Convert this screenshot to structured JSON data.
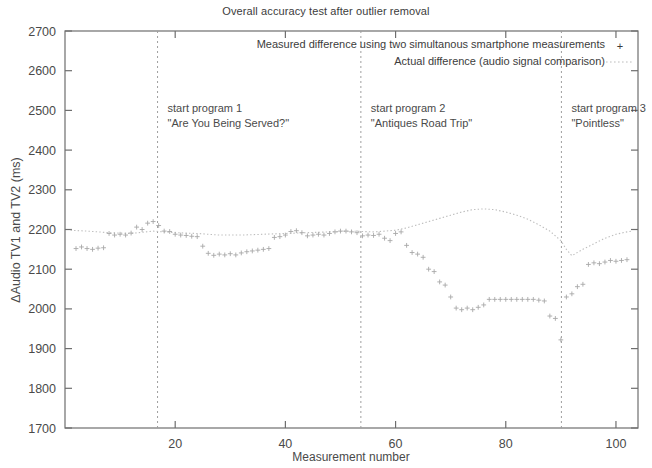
{
  "chart_data": {
    "type": "scatter",
    "title": "Overall accuracy test after outlier removal",
    "xlabel": "Measurement number",
    "ylabel": "ΔAudio TV1 and TV2 (ms)",
    "xlim": [
      0,
      104
    ],
    "ylim": [
      1700,
      2700
    ],
    "xticks": [
      20,
      40,
      60,
      80,
      100
    ],
    "yticks": [
      1700,
      1800,
      1900,
      2000,
      2100,
      2200,
      2300,
      2400,
      2500,
      2600,
      2700
    ],
    "grid": false,
    "legend_position": "top-center",
    "legend": [
      {
        "label": "Measured difference using two simultanous smartphone measurements",
        "marker": "plus",
        "style": "points",
        "color": "#9a9a9a"
      },
      {
        "label": "Actual difference (audio signal comparison)",
        "marker": "dotted-line",
        "style": "line",
        "color": "#b0b0b0"
      }
    ],
    "annotations": [
      {
        "x": 16.8,
        "line1": "start program 1",
        "line2": "\"Are You Being Served?\""
      },
      {
        "x": 53.7,
        "line1": "start program 2",
        "line2": "\"Antiques Road Trip\""
      },
      {
        "x": 90.1,
        "line1": "start program 3",
        "line2": "\"Pointless\""
      }
    ],
    "series": [
      {
        "name": "Measured difference using two simultanous smartphone measurements",
        "marker": "plus",
        "points": [
          [
            2,
            2152
          ],
          [
            3,
            2156
          ],
          [
            4,
            2152
          ],
          [
            5,
            2150
          ],
          [
            6,
            2153
          ],
          [
            7,
            2154
          ],
          [
            8,
            2190
          ],
          [
            9,
            2186
          ],
          [
            10,
            2188
          ],
          [
            11,
            2186
          ],
          [
            12,
            2191
          ],
          [
            13,
            2206
          ],
          [
            14,
            2200
          ],
          [
            15,
            2216
          ],
          [
            16,
            2220
          ],
          [
            17,
            2210
          ],
          [
            18,
            2196
          ],
          [
            19,
            2195
          ],
          [
            20,
            2188
          ],
          [
            21,
            2186
          ],
          [
            22,
            2185
          ],
          [
            23,
            2183
          ],
          [
            24,
            2182
          ],
          [
            25,
            2158
          ],
          [
            26,
            2140
          ],
          [
            27,
            2135
          ],
          [
            28,
            2138
          ],
          [
            29,
            2136
          ],
          [
            30,
            2139
          ],
          [
            31,
            2136
          ],
          [
            32,
            2141
          ],
          [
            33,
            2144
          ],
          [
            34,
            2146
          ],
          [
            35,
            2148
          ],
          [
            36,
            2150
          ],
          [
            37,
            2152
          ],
          [
            38,
            2180
          ],
          [
            39,
            2182
          ],
          [
            40,
            2186
          ],
          [
            41,
            2195
          ],
          [
            42,
            2197
          ],
          [
            43,
            2192
          ],
          [
            44,
            2184
          ],
          [
            45,
            2186
          ],
          [
            46,
            2188
          ],
          [
            47,
            2186
          ],
          [
            48,
            2190
          ],
          [
            49,
            2194
          ],
          [
            50,
            2196
          ],
          [
            51,
            2196
          ],
          [
            52,
            2194
          ],
          [
            53,
            2192
          ],
          [
            54,
            2184
          ],
          [
            55,
            2186
          ],
          [
            56,
            2185
          ],
          [
            57,
            2188
          ],
          [
            58,
            2178
          ],
          [
            59,
            2172
          ],
          [
            60,
            2190
          ],
          [
            61,
            2194
          ],
          [
            62,
            2160
          ],
          [
            63,
            2142
          ],
          [
            64,
            2138
          ],
          [
            65,
            2130
          ],
          [
            66,
            2100
          ],
          [
            67,
            2094
          ],
          [
            68,
            2068
          ],
          [
            69,
            2060
          ],
          [
            70,
            2030
          ],
          [
            71,
            2002
          ],
          [
            72,
            1998
          ],
          [
            73,
            2002
          ],
          [
            74,
            1998
          ],
          [
            75,
            2004
          ],
          [
            76,
            2010
          ],
          [
            77,
            2024
          ],
          [
            78,
            2024
          ],
          [
            79,
            2024
          ],
          [
            80,
            2024
          ],
          [
            81,
            2024
          ],
          [
            82,
            2024
          ],
          [
            83,
            2024
          ],
          [
            84,
            2024
          ],
          [
            85,
            2024
          ],
          [
            86,
            2022
          ],
          [
            87,
            2020
          ],
          [
            88,
            1982
          ],
          [
            89,
            1976
          ],
          [
            90,
            1922
          ],
          [
            91,
            2030
          ],
          [
            92,
            2038
          ],
          [
            93,
            2056
          ],
          [
            94,
            2062
          ],
          [
            95,
            2112
          ],
          [
            96,
            2116
          ],
          [
            97,
            2114
          ],
          [
            98,
            2118
          ],
          [
            99,
            2122
          ],
          [
            100,
            2120
          ],
          [
            101,
            2122
          ],
          [
            102,
            2124
          ]
        ]
      },
      {
        "name": "Actual difference (audio signal comparison)",
        "marker": "dotted-line",
        "points": [
          [
            1,
            2198
          ],
          [
            4,
            2196
          ],
          [
            8,
            2192
          ],
          [
            12,
            2190
          ],
          [
            16,
            2196
          ],
          [
            20,
            2192
          ],
          [
            24,
            2190
          ],
          [
            28,
            2186
          ],
          [
            32,
            2186
          ],
          [
            36,
            2188
          ],
          [
            40,
            2190
          ],
          [
            44,
            2192
          ],
          [
            48,
            2194
          ],
          [
            52,
            2196
          ],
          [
            56,
            2194
          ],
          [
            58,
            2196
          ],
          [
            60,
            2198
          ],
          [
            62,
            2204
          ],
          [
            64,
            2212
          ],
          [
            66,
            2220
          ],
          [
            68,
            2228
          ],
          [
            70,
            2236
          ],
          [
            72,
            2244
          ],
          [
            74,
            2250
          ],
          [
            76,
            2252
          ],
          [
            78,
            2250
          ],
          [
            80,
            2244
          ],
          [
            82,
            2236
          ],
          [
            84,
            2226
          ],
          [
            86,
            2212
          ],
          [
            88,
            2196
          ],
          [
            90,
            2172
          ],
          [
            91,
            2150
          ],
          [
            92,
            2134
          ],
          [
            94,
            2150
          ],
          [
            96,
            2164
          ],
          [
            98,
            2178
          ],
          [
            100,
            2188
          ],
          [
            102,
            2194
          ],
          [
            103,
            2196
          ]
        ]
      }
    ]
  }
}
